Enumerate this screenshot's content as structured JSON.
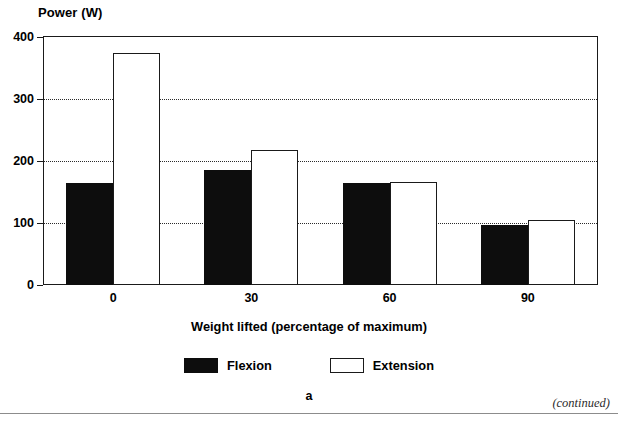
{
  "figure": {
    "panel_letter": "a",
    "footer_note": "(continued)"
  },
  "chart_data": {
    "type": "bar",
    "title": "",
    "xlabel": "Weight lifted (percentage of maximum)",
    "ylabel": "Power (W)",
    "categories": [
      "0",
      "30",
      "60",
      "90"
    ],
    "series": [
      {
        "name": "Flexion",
        "color": "#0d0d0d",
        "values": [
          165,
          185,
          165,
          97
        ]
      },
      {
        "name": "Extension",
        "color": "#ffffff",
        "values": [
          375,
          218,
          166,
          105
        ]
      }
    ],
    "ylim": [
      0,
      400
    ],
    "yticks": [
      0,
      100,
      200,
      300,
      400
    ],
    "ytick_labels": [
      "0",
      "100",
      "200",
      "300",
      "400"
    ],
    "grid": "horizontal-dotted",
    "grid_values": [
      100,
      200,
      300
    ],
    "legend_position": "bottom-center"
  }
}
